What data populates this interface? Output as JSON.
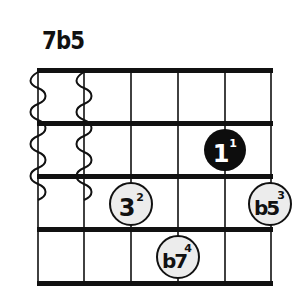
{
  "chord": {
    "name": "7b5",
    "strings": 6,
    "frets_shown": 4,
    "muted_strings": [
      6,
      5
    ],
    "string_x": [
      38,
      84,
      130,
      178,
      225,
      271
    ],
    "fret_y": [
      70,
      123,
      176,
      229,
      283
    ],
    "dots": [
      {
        "degree": "1",
        "finger": "1",
        "string_index": 4,
        "fret": 2,
        "cx": 225,
        "cy": 150,
        "style": "root-filled"
      },
      {
        "degree": "3",
        "finger": "2",
        "string_index": 2,
        "fret": 3,
        "cx": 131,
        "cy": 204,
        "style": "open"
      },
      {
        "degree": "b5",
        "finger": "3",
        "string_index": 5,
        "fret": 3,
        "cx": 270,
        "cy": 204,
        "style": "open"
      },
      {
        "degree": "b7",
        "finger": "4",
        "string_index": 3,
        "fret": 4,
        "cx": 178,
        "cy": 257,
        "style": "open"
      }
    ]
  },
  "colors": {
    "line": "#111111",
    "root_fill": "#0d0d0d",
    "root_text": "#ffffff",
    "dot_fill": "#ececec",
    "dot_stroke": "#111111",
    "dot_text": "#111111"
  }
}
